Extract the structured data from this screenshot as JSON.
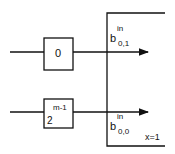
{
  "diagram": {
    "blocks": [
      {
        "id": "top",
        "label": "0"
      },
      {
        "id": "bottom",
        "label_base": "2",
        "label_exp": "m-1"
      }
    ],
    "outputs": [
      {
        "id": "b01",
        "base": "b",
        "superscript": "in",
        "subscript": "0,1"
      },
      {
        "id": "b00",
        "base": "b",
        "superscript": "in",
        "subscript": "0,0"
      }
    ],
    "region_label": "x=1",
    "colors": {
      "stroke": "#111111",
      "background": "#ffffff"
    }
  }
}
